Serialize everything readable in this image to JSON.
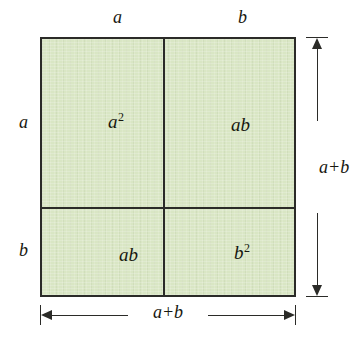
{
  "diagram": {
    "identity": "(a+b)^2 = a^2 + 2ab + b^2",
    "fill_color": "#d9e6c4",
    "line_color": "#2b2b28",
    "background_color": "#ffffff"
  },
  "cells": {
    "top_left": {
      "base": "a",
      "exponent": "2"
    },
    "top_right": {
      "base": "ab",
      "exponent": ""
    },
    "bottom_left": {
      "base": "ab",
      "exponent": ""
    },
    "bottom_right": {
      "base": "b",
      "exponent": "2"
    }
  },
  "edge_labels": {
    "top_left_segment": "a",
    "top_right_segment": "b",
    "left_top_segment": "a",
    "left_bottom_segment": "b"
  },
  "dimensions": {
    "bottom": "a+b",
    "right": "a+b"
  },
  "chart_data": {
    "type": "diagram",
    "categories": [
      "a²",
      "ab",
      "ab",
      "b²"
    ],
    "values": [
      1,
      1,
      1,
      1
    ],
    "xlabel": "a+b",
    "ylabel": "a+b",
    "annotations": [
      "a",
      "b",
      "a",
      "b",
      "a+b",
      "a+b"
    ]
  }
}
